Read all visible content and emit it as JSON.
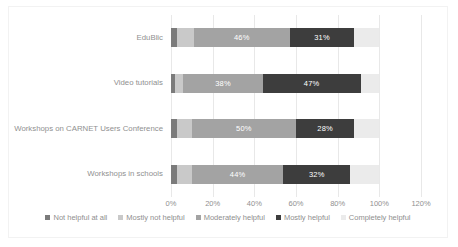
{
  "chart_data": {
    "type": "bar",
    "subtype": "horizontal-stacked-100",
    "title": "",
    "xlabel": "",
    "ylabel": "",
    "xlim": [
      0,
      120
    ],
    "xticks": [
      "0%",
      "20%",
      "40%",
      "60%",
      "80%",
      "100%",
      "120%"
    ],
    "xtick_values": [
      0,
      20,
      40,
      60,
      80,
      100,
      120
    ],
    "grid": true,
    "legend_position": "bottom",
    "categories": [
      "EduBlic",
      "Video tutorials",
      "Workshops on CARNET Users Conference",
      "Workshops in schools"
    ],
    "series": [
      {
        "name": "Not helpful at all",
        "color": "#7b7b7b",
        "values": [
          3,
          2,
          3,
          3
        ],
        "labels": [
          "",
          "",
          "",
          ""
        ]
      },
      {
        "name": "Mostly not helpful",
        "color": "#c9c9c9",
        "values": [
          8,
          4,
          7,
          7
        ],
        "labels": [
          "",
          "",
          "",
          ""
        ]
      },
      {
        "name": "Moderately helpful",
        "color": "#a3a3a3",
        "values": [
          46,
          38,
          50,
          44
        ],
        "labels": [
          "46%",
          "38%",
          "50%",
          "44%"
        ]
      },
      {
        "name": "Mostly helpful",
        "color": "#3d3d3d",
        "values": [
          31,
          47,
          28,
          32
        ],
        "labels": [
          "31%",
          "47%",
          "28%",
          "32%"
        ]
      },
      {
        "name": "Completely helpful",
        "color": "#ebebeb",
        "values": [
          12,
          9,
          12,
          14
        ],
        "labels": [
          "",
          "",
          "",
          ""
        ]
      }
    ]
  },
  "colors": {
    "plot_background": "#ffffff",
    "gridline": "#e8e8e8",
    "frame_border": "#f2f2f2",
    "tick_text": "#909090",
    "legend_text": "#8f8f8f"
  }
}
